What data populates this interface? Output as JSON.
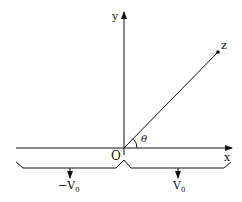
{
  "diagram": {
    "axes": {
      "x_label": "x",
      "y_label": "y",
      "origin_label": "O"
    },
    "line": {
      "end_label": "z",
      "angle_label": "θ"
    },
    "plates": {
      "left": {
        "potential": "−V",
        "subscript": "0"
      },
      "right": {
        "potential": "V",
        "subscript": "0"
      }
    },
    "colors": {
      "stroke": "#111111",
      "background": "#ffffff"
    }
  }
}
